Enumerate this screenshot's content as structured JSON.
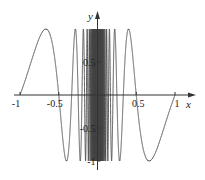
{
  "chart_data": {
    "type": "line",
    "title": "",
    "function": "y = sin(pi / x)",
    "xlabel": "x",
    "ylabel": "y",
    "xlim": [
      -1,
      1
    ],
    "ylim": [
      -1,
      1
    ],
    "grid": false,
    "legend": "none",
    "x_ticks": [
      {
        "value": -1,
        "label": "-1"
      },
      {
        "value": -0.5,
        "label": "-0.5"
      },
      {
        "value": 0.5,
        "label": "0.5"
      },
      {
        "value": 1,
        "label": "1"
      }
    ],
    "y_ticks": [
      {
        "value": 0.5,
        "label": "0.5"
      },
      {
        "value": -0.5,
        "label": "-0.5"
      },
      {
        "value": -1,
        "label": "-1"
      }
    ],
    "series": [
      {
        "name": "sin(pi/x)",
        "color": "#444444",
        "sample_points": [
          [
            -1,
            0
          ],
          [
            -0.6667,
            1
          ],
          [
            -0.5,
            0
          ],
          [
            -0.4,
            -1
          ],
          [
            -0.3333,
            0
          ],
          [
            -0.2857,
            1
          ],
          [
            -0.25,
            0
          ],
          [
            0.25,
            0
          ],
          [
            0.2857,
            -1
          ],
          [
            0.3333,
            0
          ],
          [
            0.4,
            1
          ],
          [
            0.5,
            0
          ],
          [
            0.6667,
            -1
          ],
          [
            1,
            0
          ]
        ]
      }
    ]
  }
}
